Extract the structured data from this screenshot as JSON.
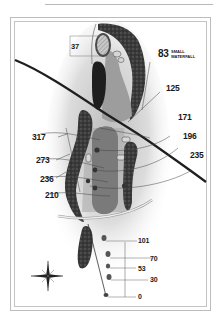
{
  "hole_map": {
    "green_depth": "37",
    "hazard_note": {
      "distance": "83",
      "label_line1": "SMALL",
      "label_line2": "WATERFALL"
    },
    "right_distances": [
      "125",
      "171",
      "196",
      "235"
    ],
    "left_distances": [
      "317",
      "273",
      "236",
      "210"
    ],
    "tee_markers": [
      "101",
      "70",
      "53",
      "30",
      "0"
    ],
    "compass": {
      "icon": "compass-rose-icon",
      "directions": [
        "N",
        "E",
        "S",
        "W"
      ]
    },
    "colors": {
      "rough": "#d9d9d9",
      "fairway": "#9a9a9a",
      "trees": "#3c3c3c",
      "water": "#1e1e1e",
      "frame": "#bdbdbd"
    }
  }
}
